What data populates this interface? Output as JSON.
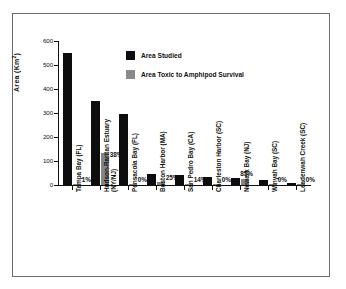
{
  "chart_data": {
    "type": "bar",
    "title": "",
    "xlabel": "",
    "ylabel": "Area (Km2)",
    "ylabel_base": "Area (Km",
    "ylabel_sup": "2",
    "ylabel_close": ")",
    "ylim": [
      0,
      600
    ],
    "yticks": [
      0,
      100,
      200,
      300,
      400,
      500,
      600
    ],
    "ytick_labels": [
      "0",
      "100",
      "200",
      "300",
      "400",
      "500",
      "600"
    ],
    "grid": false,
    "legend_position": "upper-center",
    "categories": [
      "Tampa Bay (FL)",
      "Hudson-Raritan Estuary (NY/NJ)",
      "Pensacola Bay (FL)",
      "Boston Harbor (MA)",
      "San Pedro Bay (CA)",
      "Charleston Harbor (SC)",
      "Newark Bay (NJ)",
      "Winyah Bay (SC)",
      "Leadenwah Creek (SC)"
    ],
    "category_lines": [
      [
        "Tampa Bay (FL)",
        ""
      ],
      [
        "Hudson-Raritan Estuary",
        "(NY/NJ)"
      ],
      [
        "Pensacola Bay (FL)",
        ""
      ],
      [
        "Boston Harbor (MA)",
        ""
      ],
      [
        "San Pedro Bay (CA)",
        ""
      ],
      [
        "Charleston Harbor (SC)",
        ""
      ],
      [
        "Newark Bay (NJ)",
        ""
      ],
      [
        "Winyah Bay (SC)",
        ""
      ],
      [
        "Leadenwah Creek (SC)",
        ""
      ]
    ],
    "series": [
      {
        "name": "Area Studied",
        "color": "#0d0d0d",
        "values": [
          550,
          352,
          295,
          45,
          40,
          35,
          28,
          20,
          8
        ]
      },
      {
        "name": "Area Toxic to Amphipod Survival",
        "color": "#848484",
        "values": [
          5.5,
          134,
          0,
          11,
          5.6,
          0,
          24,
          0,
          0
        ]
      }
    ],
    "annotations": [
      "1%",
      "38%",
      "0%",
      "25%",
      "14%",
      "0%",
      "85%",
      "0%",
      "0%"
    ]
  },
  "legend": {
    "items": [
      {
        "label": "Area Studied",
        "swatch": "black"
      },
      {
        "label": "Area Toxic to Amphipod Survival",
        "swatch": "gray"
      }
    ]
  }
}
